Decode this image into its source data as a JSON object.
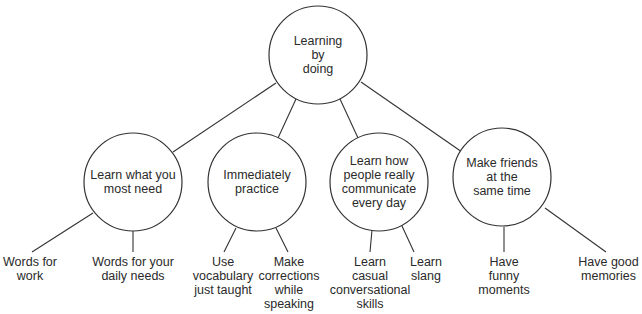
{
  "root": {
    "label": "Learning\nby\ndoing"
  },
  "branches": [
    {
      "label": "Learn what you\nmost need",
      "leaves": [
        {
          "label": "Words for\nwork"
        },
        {
          "label": "Words for your\ndaily needs"
        }
      ]
    },
    {
      "label": "Immediately\npractice",
      "leaves": [
        {
          "label": "Use\nvocabulary\njust taught"
        },
        {
          "label": "Make\ncorrections\nwhile\nspeaking"
        }
      ]
    },
    {
      "label": "Learn how\npeople really\ncommunicate\nevery day",
      "leaves": [
        {
          "label": "Learn\ncasual\nconversational\nskills"
        },
        {
          "label": "Learn\nslang"
        }
      ]
    },
    {
      "label": "Make friends\nat the\nsame time",
      "leaves": [
        {
          "label": "Have\nfunny\nmoments"
        },
        {
          "label": "Have good\nmemories"
        }
      ]
    }
  ],
  "colors": {
    "line": "#333333",
    "text": "#2a2a2a",
    "background": "#ffffff"
  }
}
